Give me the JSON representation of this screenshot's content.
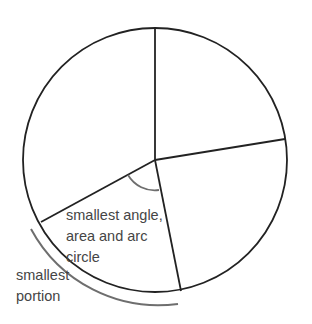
{
  "diagram": {
    "type": "circle-sectors",
    "colors": {
      "circle_stroke": "#222222",
      "annotation_stroke": "#6e6e6e",
      "text": "#454545",
      "background": "#ffffff"
    },
    "circle": {
      "cx": 155,
      "cy": 160,
      "r": 132
    },
    "radii_endpoints": [
      {
        "name": "top",
        "x": 155,
        "y": 28
      },
      {
        "name": "right",
        "x": 285,
        "y": 139
      },
      {
        "name": "bottom",
        "x": 181,
        "y": 291
      },
      {
        "name": "lower-left",
        "x": 41,
        "y": 222
      }
    ],
    "labels": {
      "angle_label": {
        "line1": "smallest angle,",
        "line2": "area and arc",
        "line3": "circle"
      },
      "portion_label": {
        "line1": "smallest",
        "line2": "portion"
      }
    }
  }
}
